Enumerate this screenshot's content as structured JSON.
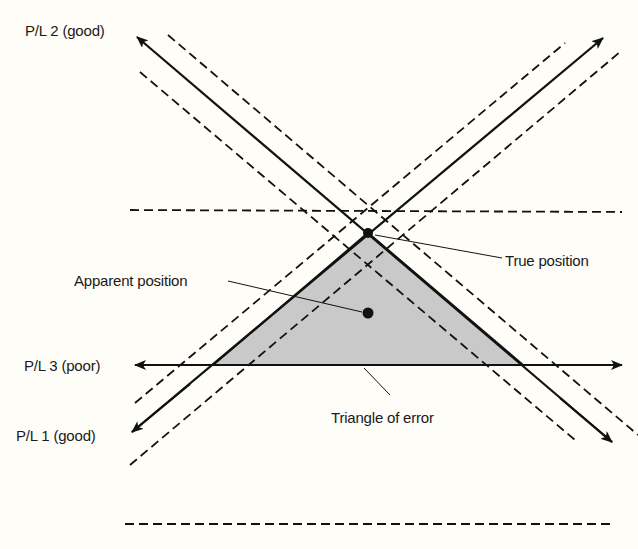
{
  "colors": {
    "background": "#fefdf8",
    "ink": "#111111",
    "triangle_fill": "#c9c9c9"
  },
  "labels": {
    "pl2": "P/L 2 (good)",
    "pl3": "P/L 3 (poor)",
    "pl1": "P/L 1 (good)",
    "true_position": "True position",
    "apparent_position": "Apparent position",
    "triangle_of_error": "Triangle of error"
  },
  "position_lines": [
    {
      "id": "pl1",
      "name": "P/L 1",
      "quality": "good",
      "solid": [
        [
          130,
          433
        ],
        [
          603,
          38
        ]
      ],
      "error_band_dashed": true
    },
    {
      "id": "pl2",
      "name": "P/L 2",
      "quality": "good",
      "solid": [
        [
          135,
          35
        ],
        [
          612,
          442
        ]
      ],
      "error_band_dashed": true
    },
    {
      "id": "pl3",
      "name": "P/L 3",
      "quality": "poor",
      "solid": [
        [
          135,
          365
        ],
        [
          622,
          365
        ]
      ],
      "error_band_dashed": true
    }
  ],
  "points": {
    "true_position": [
      368,
      233
    ],
    "apparent_position": [
      368,
      313
    ]
  }
}
